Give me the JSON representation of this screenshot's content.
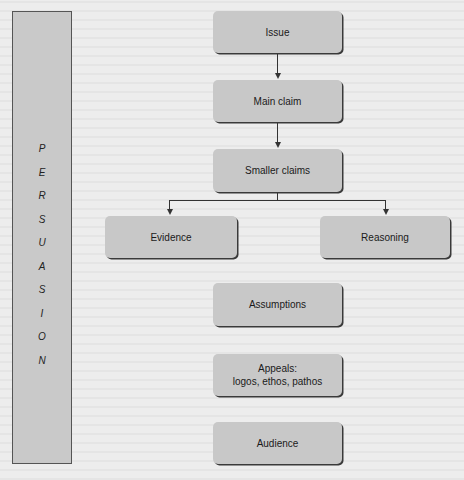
{
  "diagram": {
    "type": "flowchart",
    "side_label": {
      "text": "PERSUASION",
      "letters": [
        "P",
        "E",
        "R",
        "S",
        "U",
        "A",
        "S",
        "I",
        "O",
        "N"
      ]
    },
    "nodes": {
      "issue": {
        "label": "Issue"
      },
      "main_claim": {
        "label": "Main claim"
      },
      "smaller_claims": {
        "label": "Smaller claims"
      },
      "evidence": {
        "label": "Evidence"
      },
      "reasoning": {
        "label": "Reasoning"
      },
      "assumptions": {
        "label": "Assumptions"
      },
      "appeals": {
        "line1": "Appeals:",
        "line2": "logos, ethos, pathos"
      },
      "audience": {
        "label": "Audience"
      }
    },
    "edges": [
      {
        "from": "Issue",
        "to": "Main claim"
      },
      {
        "from": "Main claim",
        "to": "Smaller claims"
      },
      {
        "from": "Smaller claims",
        "to": "Evidence"
      },
      {
        "from": "Smaller claims",
        "to": "Reasoning"
      }
    ],
    "colors": {
      "box_fill": "#c8c8c8",
      "box_shadow": "#3a3a3a",
      "side_bar_fill": "#c9c9c9",
      "background": "#ededed",
      "line": "#333333"
    }
  }
}
